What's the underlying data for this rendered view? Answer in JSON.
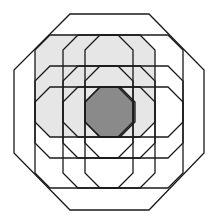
{
  "figure": {
    "title": "",
    "colors": {
      "background": "#ffffff",
      "stroke": "#1a1a1a",
      "light_fill": "#e6e6e6",
      "dark_fill": "#8a8a8a"
    },
    "outer_octagon": {
      "points": "70,14 149,14 204,70 204,153 149,210 70,210 14,153 14,70"
    },
    "light_region": {
      "points": "50,35 140,35 155,50 155,122 140,137 50,137 35,122 35,50"
    },
    "dark_region": {
      "points": "100,87 120,87 135,102 135,122 120,137 100,137 85,122 85,102"
    },
    "inner_octagons": [
      {
        "name": "octagon-r1-c1",
        "points": "50,35 118,35 133,50 133,122 118,137 50,137 35,122 35,50"
      },
      {
        "name": "octagon-r1-c2",
        "points": "78,35 140,35 155,50 155,122 140,137 78,137 63,122 63,50"
      },
      {
        "name": "octagon-r1-c3",
        "points": "100,35 168,35 183,50 183,122 168,137 100,137 85,122 85,50"
      },
      {
        "name": "octagon-r2-c1",
        "points": "50,66 118,66 133,81 133,143 118,158 50,158 35,143 35,81"
      },
      {
        "name": "octagon-r2-c2",
        "points": "78,66 140,66 155,81 155,143 140,158 78,158 63,143 63,81"
      },
      {
        "name": "octagon-r2-c3",
        "points": "100,66 168,66 183,81 183,143 168,158 100,158 85,143 85,81"
      },
      {
        "name": "octagon-r3-c1",
        "points": "50,87 118,87 133,102 133,173 118,188 50,188 35,173 35,102"
      },
      {
        "name": "octagon-r3-c2",
        "points": "78,87 140,87 155,102 155,173 140,188 78,188 63,173 63,102"
      },
      {
        "name": "octagon-r3-c3",
        "points": "100,87 168,87 183,102 183,173 168,188 100,188 85,173 85,102"
      }
    ]
  }
}
